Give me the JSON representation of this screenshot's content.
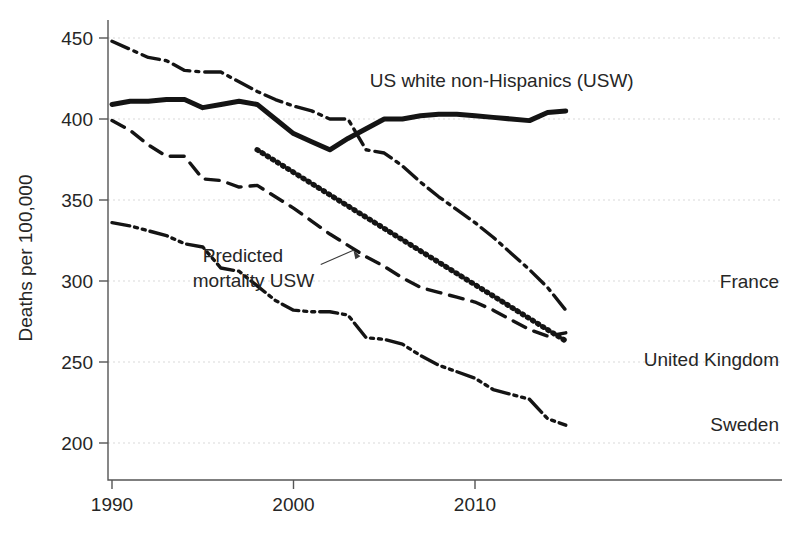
{
  "chart_data": {
    "type": "line",
    "title": "",
    "subtitle": "",
    "xlabel": "",
    "ylabel": "Deaths per 100,000",
    "xlim": [
      1989,
      2016.5
    ],
    "ylim": [
      180,
      462
    ],
    "xticks": [
      1990,
      2000,
      2010
    ],
    "xtick_labels": [
      "1990",
      "2000",
      "2010"
    ],
    "yticks": [
      200,
      250,
      300,
      350,
      400,
      450
    ],
    "ytick_labels": [
      "200",
      "250",
      "300",
      "350",
      "400",
      "450"
    ],
    "grid": "horizontal-dotted",
    "legend": "inline-series-labels",
    "series": [
      {
        "name": "US white non-Hispanics (USW)",
        "style": "solid",
        "label_x": 2004.2,
        "label_y": 424,
        "x": [
          1990,
          1991,
          1992,
          1993,
          1994,
          1995,
          1996,
          1997,
          1998,
          1999,
          2000,
          2001,
          2002,
          2003,
          2004,
          2005,
          2006,
          2007,
          2008,
          2009,
          2010,
          2011,
          2012,
          2013,
          2014,
          2015
        ],
        "values": [
          409,
          411,
          411,
          412,
          412,
          407,
          409,
          411,
          409,
          400,
          391,
          386,
          381,
          388,
          394,
          400,
          400,
          402,
          403,
          403,
          402,
          401,
          400,
          399,
          404,
          405
        ]
      },
      {
        "name": "France",
        "style": "dash-dot",
        "label_x": 2013.2,
        "label_y": 300,
        "x": [
          1990,
          1991,
          1992,
          1993,
          1994,
          1995,
          1996,
          1997,
          1998,
          1999,
          2000,
          2001,
          2002,
          2003,
          2004,
          2005,
          2006,
          2007,
          2008,
          2009,
          2010,
          2011,
          2012,
          2013,
          2014,
          2015
        ],
        "values": [
          448,
          443,
          438,
          436,
          430,
          429,
          429,
          423,
          417,
          412,
          408,
          405,
          400,
          400,
          381,
          379,
          371,
          361,
          352,
          344,
          336,
          327,
          317,
          307,
          296,
          282
        ]
      },
      {
        "name": "United Kingdom",
        "style": "dashed",
        "label_x": 2009.2,
        "label_y": 252,
        "x": [
          1990,
          1991,
          1992,
          1993,
          1994,
          1995,
          1996,
          1997,
          1998,
          1999,
          2000,
          2001,
          2002,
          2003,
          2004,
          2005,
          2006,
          2007,
          2008,
          2009,
          2010,
          2011,
          2012,
          2013,
          2014,
          2015
        ],
        "values": [
          399,
          393,
          384,
          377,
          377,
          363,
          362,
          358,
          359,
          352,
          345,
          337,
          329,
          322,
          315,
          309,
          302,
          296,
          293,
          290,
          287,
          282,
          276,
          270,
          266,
          268
        ]
      },
      {
        "name": "Sweden",
        "style": "dash-dot-dot",
        "label_x": 2013.4,
        "label_y": 212,
        "x": [
          1990,
          1991,
          1992,
          1993,
          1994,
          1995,
          1996,
          1997,
          1998,
          1999,
          2000,
          2001,
          2002,
          2003,
          2004,
          2005,
          2006,
          2007,
          2008,
          2009,
          2010,
          2011,
          2012,
          2013,
          2014,
          2015
        ],
        "values": [
          336,
          334,
          331,
          328,
          323,
          321,
          308,
          306,
          297,
          288,
          282,
          281,
          281,
          279,
          265,
          264,
          261,
          254,
          248,
          244,
          240,
          233,
          230,
          227,
          215,
          211
        ]
      },
      {
        "name": "Predicted mortality USW",
        "style": "dotted-thick",
        "label_x": 1995.0,
        "label_y": 312,
        "x": [
          1998,
          2015
        ],
        "values": [
          381,
          263
        ]
      }
    ],
    "annotations": [
      {
        "text_line1": "Predicted",
        "text_line2": "mortality USW",
        "target_x": 2003.3,
        "target_y": 319
      }
    ]
  },
  "colors": {
    "line": "#141414",
    "grid": "#d9d9d9",
    "axis": "#555555",
    "text": "#262626",
    "background": "#ffffff"
  },
  "axis": {
    "y_title": "Deaths per 100,000"
  },
  "labels": {
    "usw": "US white non-Hispanics (USW)",
    "france": "France",
    "uk": "United Kingdom",
    "sweden": "Sweden",
    "predicted_line1": "Predicted",
    "predicted_line2": "mortality USW"
  },
  "ticks": {
    "y": [
      "450",
      "400",
      "350",
      "300",
      "250",
      "200"
    ],
    "x": [
      "1990",
      "2000",
      "2010"
    ]
  }
}
